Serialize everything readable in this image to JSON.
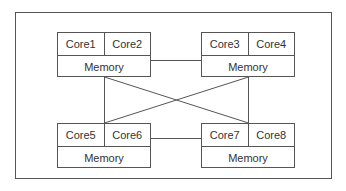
{
  "diagram": {
    "nodes": [
      {
        "cores": [
          "Core1",
          "Core2"
        ],
        "memory": "Memory"
      },
      {
        "cores": [
          "Core3",
          "Core4"
        ],
        "memory": "Memory"
      },
      {
        "cores": [
          "Core5",
          "Core6"
        ],
        "memory": "Memory"
      },
      {
        "cores": [
          "Core7",
          "Core8"
        ],
        "memory": "Memory"
      }
    ],
    "colors": {
      "line": "#555555",
      "text": "#333333",
      "background": "#ffffff"
    }
  }
}
